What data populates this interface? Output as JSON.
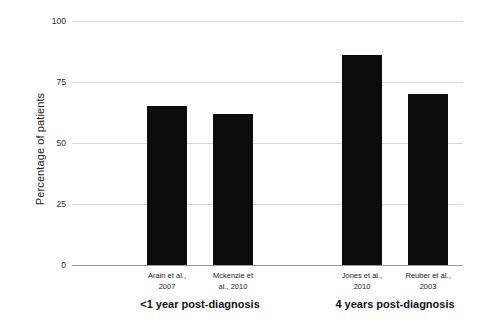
{
  "chart_data": {
    "type": "bar",
    "title": "",
    "xlabel": "",
    "ylabel": "Percentage of patients",
    "ylim": [
      0,
      100
    ],
    "yticks": [
      0,
      25,
      50,
      75,
      100
    ],
    "ytick_labels": [
      "0",
      "25",
      "50",
      "75",
      "100"
    ],
    "grid": true,
    "legend": "none",
    "bar_color": "#0c0c0c",
    "categories": [
      "Arain et al., 2007",
      "Mckenzie et al., 2010",
      "Jones et al., 2010",
      "Reuber et al., 2003"
    ],
    "values": [
      65,
      62,
      86,
      70
    ],
    "bars": [
      {
        "label_line1": "Arain et al.,",
        "label_line2": "2007",
        "value": 65,
        "group": "<1 year post-diagnosis"
      },
      {
        "label_line1": "Mckenzie et",
        "label_line2": "al., 2010",
        "value": 62,
        "group": "<1 year post-diagnosis"
      },
      {
        "label_line1": "Jones et al.,",
        "label_line2": "2010",
        "value": 86,
        "group": "4 years post-diagnosis"
      },
      {
        "label_line1": "Reuber et al.,",
        "label_line2": "2003",
        "value": 70,
        "group": "4 years post-diagnosis"
      }
    ],
    "groups": [
      {
        "label": "<1 year post-diagnosis"
      },
      {
        "label": "4 years post-diagnosis"
      }
    ]
  }
}
